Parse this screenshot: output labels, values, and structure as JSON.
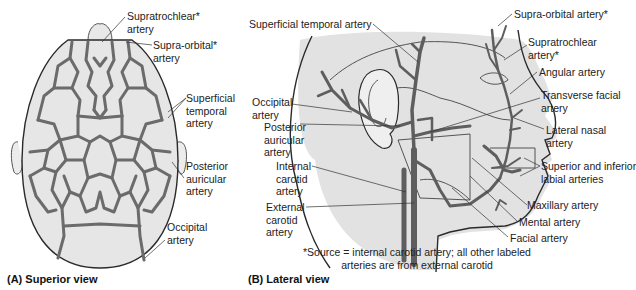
{
  "panel_a": {
    "caption": "(A) Superior view",
    "labels": {
      "supratrochlear": [
        "Supratrochlear*",
        "artery"
      ],
      "supraorbital": [
        "Supra-orbital*",
        "artery"
      ],
      "superficial_temporal": [
        "Superficial",
        "temporal",
        "artery"
      ],
      "posterior_auricular": [
        "Posterior",
        "auricular",
        "artery"
      ],
      "occipital": [
        "Occipital",
        "artery"
      ]
    }
  },
  "panel_b": {
    "caption": "(B) Lateral view",
    "labels": {
      "superficial_temporal": "Superficial temporal artery",
      "occipital": [
        "Occipital",
        "artery"
      ],
      "posterior_auricular": [
        "Posterior",
        "auricular",
        "artery"
      ],
      "internal_carotid": [
        "Internal",
        "carotid",
        "artery"
      ],
      "external_carotid": [
        "External",
        "carotid",
        "artery"
      ],
      "supraorbital": "Supra-orbital artery*",
      "supratrochlear": [
        "Supratrochlear",
        "artery*"
      ],
      "angular": "Angular artery",
      "transverse_facial": [
        "Transverse facial",
        "artery"
      ],
      "lateral_nasal": [
        "Lateral nasal",
        "artery"
      ],
      "labial": [
        "Superior and inferior",
        "labial arteries"
      ],
      "maxillary": "Maxillary artery",
      "mental": "Mental artery",
      "facial": "Facial artery"
    },
    "footnote": [
      "*Source = internal carotid artery; all other labeled",
      "arteries are from external carotid"
    ]
  },
  "colors": {
    "artery": "#6b6b6b",
    "skin": "#e4e4e4",
    "outline": "#3a3a3a"
  }
}
